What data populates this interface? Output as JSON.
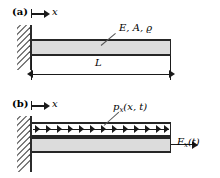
{
  "figure": {
    "type": "engineering-diagram",
    "panels": [
      {
        "id": "a",
        "label": "(a)",
        "axis_label": "x",
        "material_label": "E, A, ϱ",
        "length_label": "L"
      },
      {
        "id": "b",
        "label": "(b)",
        "axis_label": "x",
        "distributed_load_label": "p",
        "distributed_load_sub": "x",
        "distributed_load_args": "(x, t)",
        "end_force_label": "F",
        "end_force_sub": "x",
        "end_force_args": "(t)"
      }
    ]
  },
  "colors": {
    "beam_fill": "#dcdcdc",
    "beam_edge": "#262626",
    "wall_line": "#2b2b2b",
    "hatch": "#4a4a4a",
    "ink": "#1a1a1a",
    "background": "#ffffff"
  },
  "geometry": {
    "arrow_count": 13
  }
}
